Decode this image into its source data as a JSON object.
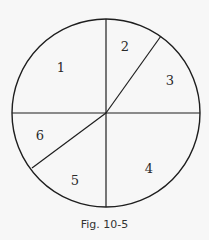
{
  "diagram": {
    "type": "circle-partition",
    "circle": {
      "cx": 106,
      "cy": 113,
      "r": 94
    },
    "lines": [
      {
        "name": "vertical-diameter",
        "x1": 106,
        "y1": 19,
        "x2": 106,
        "y2": 207
      },
      {
        "name": "horizontal-diameter",
        "x1": 12,
        "y1": 113,
        "x2": 200,
        "y2": 113
      },
      {
        "name": "upper-right-radius",
        "x1": 106,
        "y1": 113,
        "x2": 161,
        "y2": 36
      },
      {
        "name": "lower-left-radius",
        "x1": 106,
        "y1": 113,
        "x2": 32,
        "y2": 168
      }
    ],
    "regions": [
      {
        "label": "1",
        "x": 61,
        "y": 72
      },
      {
        "label": "2",
        "x": 125,
        "y": 51
      },
      {
        "label": "3",
        "x": 170,
        "y": 85
      },
      {
        "label": "4",
        "x": 149,
        "y": 173
      },
      {
        "label": "5",
        "x": 75,
        "y": 185
      },
      {
        "label": "6",
        "x": 40,
        "y": 140
      }
    ],
    "stroke_color": "#1e1e1e",
    "background_color": "#f7f7f7"
  },
  "caption": "Fig. 10-5"
}
